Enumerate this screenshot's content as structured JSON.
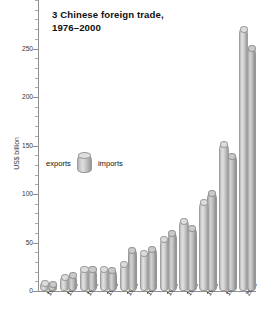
{
  "chart_data": {
    "type": "bar",
    "title": "3 Chinese foreign trade,\n1976–2000",
    "xlabel": "",
    "ylabel": "US$ billion",
    "ylim": [
      0,
      300
    ],
    "yticks": [
      0,
      50,
      100,
      150,
      200,
      250
    ],
    "ytick_labels": [
      "0",
      "50",
      "100",
      "150",
      "200",
      "250"
    ],
    "minor_tick_step": 10,
    "grid": false,
    "legend_position": "inside-left",
    "categories": [
      "1977",
      "1979",
      "1981",
      "1983",
      "1985",
      "1987",
      "1989",
      "1991",
      "1993",
      "1996",
      "2000"
    ],
    "series": [
      {
        "name": "exports",
        "values": [
          8,
          14,
          22,
          22,
          27,
          39,
          53,
          72,
          91,
          151,
          270
        ]
      },
      {
        "name": "imports",
        "values": [
          7,
          16,
          22,
          21,
          42,
          43,
          59,
          64,
          100,
          139,
          250
        ]
      }
    ]
  },
  "legend": {
    "left_label": "exports",
    "right_label": "imports",
    "swatch_name": "cylinder-swatch"
  },
  "colors": {
    "background": "#ffffff",
    "axis": "#8e8e8e",
    "text": "#1a1a1a",
    "exports_bar": "#d4d4d4",
    "imports_bar": "#bdbdbd"
  }
}
